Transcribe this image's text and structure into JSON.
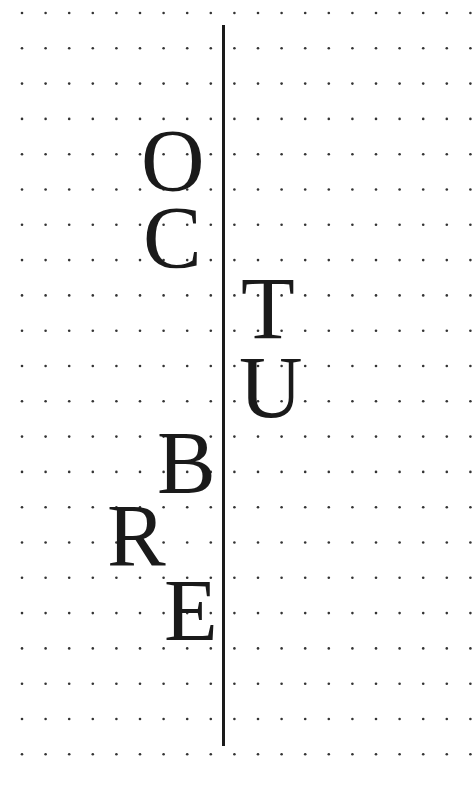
{
  "canvas": {
    "width": 474,
    "height": 800,
    "background": "#ffffff"
  },
  "grid": {
    "columns": 20,
    "rows": 22,
    "x_start": 22,
    "x_step": 23.6,
    "y_start": 13,
    "y_step": 35.3,
    "dot_radius": 1.3,
    "dot_color": "#333333"
  },
  "divider": {
    "x": 223,
    "y_top": 25,
    "y_bottom": 746,
    "color": "#1a1a1a"
  },
  "word": "OCTUBRE",
  "letters": [
    {
      "char": "O",
      "side": "left",
      "x": 141,
      "y": 117
    },
    {
      "char": "C",
      "side": "left",
      "x": 143,
      "y": 194
    },
    {
      "char": "T",
      "side": "right",
      "x": 241,
      "y": 265
    },
    {
      "char": "U",
      "side": "right",
      "x": 239,
      "y": 344
    },
    {
      "char": "B",
      "side": "left",
      "x": 157,
      "y": 419
    },
    {
      "char": "R",
      "side": "left",
      "x": 107,
      "y": 492
    },
    {
      "char": "E",
      "side": "left",
      "x": 164,
      "y": 567
    }
  ]
}
